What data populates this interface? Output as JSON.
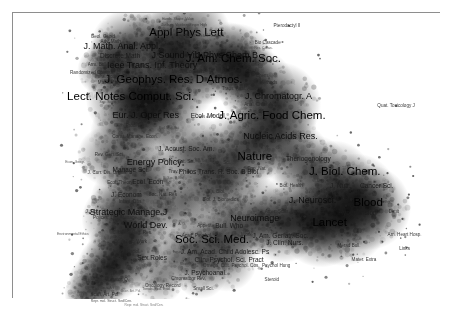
{
  "figure": {
    "kind": "science-map",
    "frame": {
      "border_color": "#8e8e8e",
      "background": "#ffffff"
    },
    "palette": {
      "background": "#ffffff",
      "density_low": "#d9d9d9",
      "density_mid": "#9a9a9a",
      "density_high": "#4a4a4a",
      "density_peak": "#1e1e1e",
      "label_color": "#111111",
      "point_color": "#2b2b2b",
      "frame_color": "#8e8e8e"
    }
  },
  "chart_data": {
    "type": "scatter",
    "title": "",
    "xlabel": "",
    "ylabel": "",
    "xlim": [
      0,
      100
    ],
    "ylim": [
      0,
      100
    ],
    "grid": false,
    "legend": "none",
    "encoding": {
      "x": "map coordinate 1",
      "y": "map coordinate 2",
      "size": "label font tier (1 = largest / most prominent journal)",
      "shade": "kernel density of journals in the neighbourhood"
    },
    "labels": [
      {
        "text": "Lect. Notes Comput. Sci.",
        "x": 27.5,
        "y": 70.5,
        "tier": 1
      },
      {
        "text": "J. Am. Chem. Soc.",
        "x": 51.5,
        "y": 84.0,
        "tier": 1
      },
      {
        "text": "J. Biol. Chem.",
        "x": 77.5,
        "y": 44.5,
        "tier": 1
      },
      {
        "text": "Appl Phys Lett",
        "x": 40.5,
        "y": 93.0,
        "tier": 1
      },
      {
        "text": "J. Geophys. Res. D Atmos.",
        "x": 37.5,
        "y": 76.5,
        "tier": 1
      },
      {
        "text": "J. Agric. Food Chem.",
        "x": 60.5,
        "y": 64.0,
        "tier": 1
      },
      {
        "text": "Lancet",
        "x": 74.0,
        "y": 26.5,
        "tier": 1
      },
      {
        "text": "Soc. Sci. Med.",
        "x": 46.5,
        "y": 20.5,
        "tier": 1
      },
      {
        "text": "Nature",
        "x": 56.5,
        "y": 49.5,
        "tier": 1
      },
      {
        "text": "Blood",
        "x": 83.0,
        "y": 33.5,
        "tier": 1
      },
      {
        "text": "Nucleic Acids Res.",
        "x": 62.5,
        "y": 57.0,
        "tier": 2
      },
      {
        "text": "J. Chromatogr. A",
        "x": 62.0,
        "y": 71.0,
        "tier": 2
      },
      {
        "text": "Eur. J. Oper Res",
        "x": 31.0,
        "y": 64.5,
        "tier": 2
      },
      {
        "text": "J. Neurosci.",
        "x": 70.0,
        "y": 34.5,
        "tier": 2
      },
      {
        "text": "Ieee Trans. Inf. Theory",
        "x": 32.5,
        "y": 82.0,
        "tier": 2
      },
      {
        "text": "J Sound Vib",
        "x": 38.0,
        "y": 85.5,
        "tier": 2
      },
      {
        "text": "J Phys Chem B",
        "x": 50.0,
        "y": 85.5,
        "tier": 2
      },
      {
        "text": "Energy Policy",
        "x": 33.0,
        "y": 48.0,
        "tier": 2
      },
      {
        "text": "World Dev.",
        "x": 31.0,
        "y": 26.0,
        "tier": 2
      },
      {
        "text": "Strategic Manage J",
        "x": 27.0,
        "y": 30.5,
        "tier": 2
      },
      {
        "text": "Neuroimage",
        "x": 56.5,
        "y": 28.5,
        "tier": 2
      },
      {
        "text": "J. Math. Anal. Appl.",
        "x": 25.5,
        "y": 88.5,
        "tier": 2
      },
      {
        "text": "Hypertension",
        "x": 80.5,
        "y": 30.0,
        "tier": 3
      },
      {
        "text": "Ecol. Econ",
        "x": 31.5,
        "y": 41.0,
        "tier": 3
      },
      {
        "text": "Manage Sci.",
        "x": 27.5,
        "y": 45.0,
        "tier": 3
      },
      {
        "text": "J. Nutr.",
        "x": 76.5,
        "y": 39.5,
        "tier": 3
      },
      {
        "text": "Sex Roles",
        "x": 32.5,
        "y": 14.5,
        "tier": 3
      },
      {
        "text": "J. Am. Acad. Child Adolesc. Ps",
        "x": 49.5,
        "y": 16.5,
        "tier": 3
      },
      {
        "text": "J. Am. Geriatr. Soc.",
        "x": 62.5,
        "y": 22.0,
        "tier": 3
      },
      {
        "text": "J. Econom",
        "x": 26.5,
        "y": 36.5,
        "tier": 3
      },
      {
        "text": "Ecol. Model",
        "x": 45.5,
        "y": 64.0,
        "tier": 3
      },
      {
        "text": "Philos Trans. R. Soc. B Biol",
        "x": 48.0,
        "y": 44.5,
        "tier": 3
      },
      {
        "text": "J. Acoust. Soc. Am.",
        "x": 40.5,
        "y": 52.5,
        "tier": 3
      },
      {
        "text": "Theriogenology",
        "x": 69.0,
        "y": 49.0,
        "tier": 3
      },
      {
        "text": "Discrete Math",
        "x": 25.0,
        "y": 85.0,
        "tier": 3
      },
      {
        "text": "Cancer Sci.",
        "x": 85.0,
        "y": 39.5,
        "tier": 3
      },
      {
        "text": "J. Clin. Nurs.",
        "x": 63.5,
        "y": 19.5,
        "tier": 3
      },
      {
        "text": "Bull. Who",
        "x": 50.5,
        "y": 25.5,
        "tier": 3
      },
      {
        "text": "Clin. Psychol. Sci. Pract",
        "x": 50.5,
        "y": 13.5,
        "tier": 3
      },
      {
        "text": "J. Psychoanal.",
        "x": 45.0,
        "y": 9.0,
        "tier": 3
      },
      {
        "text": "Appetite",
        "x": 45.0,
        "y": 25.5,
        "tier": 4
      },
      {
        "text": "Soc. Nat. Res",
        "x": 35.0,
        "y": 36.5,
        "tier": 4
      },
      {
        "text": "Ecol. Theory",
        "x": 25.0,
        "y": 40.5,
        "tier": 4
      },
      {
        "text": "Sat. Sci.",
        "x": 40.5,
        "y": 48.0,
        "tier": 4
      },
      {
        "text": "Trans. Anal. Analyst",
        "x": 53.5,
        "y": 73.5,
        "tier": 4
      },
      {
        "text": "Anal. Chim. Acta",
        "x": 58.0,
        "y": 68.0,
        "tier": 4
      },
      {
        "text": "El. Chem.",
        "x": 57.5,
        "y": 78.0,
        "tier": 4
      },
      {
        "text": "Biol. Methods",
        "x": 58.5,
        "y": 75.5,
        "tier": 4
      },
      {
        "text": "Math. Mag.",
        "x": 22.5,
        "y": 75.5,
        "tier": 4
      },
      {
        "text": "Rev. Gen. Sci.",
        "x": 22.5,
        "y": 50.5,
        "tier": 4
      },
      {
        "text": "J. Curr. Dis. Organ.",
        "x": 22.0,
        "y": 44.0,
        "tier": 4
      },
      {
        "text": "Infant. Obs.",
        "x": 27.5,
        "y": 34.0,
        "tier": 4
      },
      {
        "text": "J. Urban Reg. Res.",
        "x": 28.0,
        "y": 23.0,
        "tier": 4
      },
      {
        "text": "Br. J. Soc. Work",
        "x": 27.5,
        "y": 20.0,
        "tier": 4
      },
      {
        "text": "Am. J. Sociol.",
        "x": 26.5,
        "y": 16.5,
        "tier": 4
      },
      {
        "text": "Acad. Psychol.",
        "x": 43.0,
        "y": 22.0,
        "tier": 4
      },
      {
        "text": "Work",
        "x": 54.5,
        "y": 22.5,
        "tier": 4
      },
      {
        "text": "Omega. Cult. Psychol. Cos.",
        "x": 51.0,
        "y": 11.5,
        "tier": 4
      },
      {
        "text": "Psychol Hung",
        "x": 61.5,
        "y": 11.5,
        "tier": 4
      },
      {
        "text": "Chromatogr Rev.",
        "x": 41.0,
        "y": 7.0,
        "tier": 4
      },
      {
        "text": "Oncology Record",
        "x": 35.0,
        "y": 4.5,
        "tier": 4
      },
      {
        "text": "Small Sci.",
        "x": 44.5,
        "y": 3.5,
        "tier": 4
      },
      {
        "text": "Curator. Q.",
        "x": 24.5,
        "y": 6.5,
        "tier": 4
      },
      {
        "text": "Scan. Art. Pol.",
        "x": 21.5,
        "y": 1.5,
        "tier": 4
      },
      {
        "text": "Steroid",
        "x": 60.5,
        "y": 6.5,
        "tier": 4
      },
      {
        "text": "Merad Bull.",
        "x": 78.5,
        "y": 18.5,
        "tier": 4
      },
      {
        "text": "Mater. Extra",
        "x": 82.0,
        "y": 13.5,
        "tier": 4
      },
      {
        "text": "Links",
        "x": 91.5,
        "y": 17.5,
        "tier": 4
      },
      {
        "text": "Dimit",
        "x": 89.0,
        "y": 30.5,
        "tier": 4
      },
      {
        "text": "Am. Heart Hosp.",
        "x": 91.5,
        "y": 22.5,
        "tier": 4
      },
      {
        "text": "Quat. Toxicology J",
        "x": 89.5,
        "y": 67.5,
        "tier": 4
      },
      {
        "text": "Pterodactyl II",
        "x": 64.0,
        "y": 95.5,
        "tier": 4
      },
      {
        "text": "Bio Cascade",
        "x": 59.5,
        "y": 89.5,
        "tier": 4
      },
      {
        "text": "Mech. Combust.",
        "x": 41.0,
        "y": 79.5,
        "tier": 4
      },
      {
        "text": "Arm. Bulletin",
        "x": 20.5,
        "y": 82.0,
        "tier": 4
      },
      {
        "text": "Randomized Comput.",
        "x": 18.5,
        "y": 79.0,
        "tier": 4
      },
      {
        "text": "Geol. Geoid",
        "x": 21.0,
        "y": 91.5,
        "tier": 4
      },
      {
        "text": "Adv. Math.",
        "x": 23.0,
        "y": 90.0,
        "tier": 4
      },
      {
        "text": "Infra. Sci.",
        "x": 21.5,
        "y": 77.5,
        "tier": 4
      },
      {
        "text": "Proc. Lgwl.",
        "x": 29.0,
        "y": 60.5,
        "tier": 4
      },
      {
        "text": "Const. Manage. Econ.",
        "x": 28.5,
        "y": 56.5,
        "tier": 4
      },
      {
        "text": "Vis. Biol.",
        "x": 47.5,
        "y": 37.5,
        "tier": 4
      },
      {
        "text": "Biol. J. Biomedics",
        "x": 48.5,
        "y": 34.5,
        "tier": 4
      },
      {
        "text": "Biol. Health",
        "x": 65.0,
        "y": 39.5,
        "tier": 4
      },
      {
        "text": "Amer. Scan. Behav.",
        "x": 63.5,
        "y": 30.5,
        "tier": 4
      },
      {
        "text": "Trav.",
        "x": 37.5,
        "y": 44.5,
        "tier": 4
      },
      {
        "text": "Sci.",
        "x": 50.0,
        "y": 47.5,
        "tier": 4
      },
      {
        "text": "Pop. Nat.",
        "x": 57.0,
        "y": 45.5,
        "tier": 4
      },
      {
        "text": "J. Tax.",
        "x": 18.5,
        "y": 30.5,
        "tier": 4
      },
      {
        "text": "Polices. Libr. Manage.",
        "x": 24.0,
        "y": 28.5,
        "tier": 4
      },
      {
        "text": "Environmental Ethics",
        "x": 14.0,
        "y": 22.5,
        "tier": 5
      },
      {
        "text": "Econ. Geogr.",
        "x": 14.5,
        "y": 47.5,
        "tier": 5
      },
      {
        "text": "Tetrahedron",
        "x": 31.5,
        "y": 73.5,
        "tier": 5
      },
      {
        "text": "A. G.",
        "x": 39.5,
        "y": 26.0,
        "tier": 5
      },
      {
        "text": "Sal. Sci.",
        "x": 44.0,
        "y": 48.0,
        "tier": 5
      },
      {
        "text": "R. Soc. B Biol",
        "x": 37.5,
        "y": 42.0,
        "tier": 5
      },
      {
        "text": "Inquiry",
        "x": 38.5,
        "y": 16.0,
        "tier": 5
      },
      {
        "text": "Rhizo. Res.",
        "x": 41.0,
        "y": 12.0,
        "tier": 5
      },
      {
        "text": "Sun. Soc. Sci.",
        "x": 27.5,
        "y": 10.5,
        "tier": 5
      },
      {
        "text": "Trends. Ecol. Evol.",
        "x": 33.5,
        "y": 3.0,
        "tier": 5
      },
      {
        "text": "Scan. Art.",
        "x": 22.0,
        "y": 3.5,
        "tier": 5
      },
      {
        "text": "Hands. Shape. Value",
        "x": 38.5,
        "y": 97.5,
        "tier": 5
      },
      {
        "text": "Tanburg. Viceberg Finger High",
        "x": 40.0,
        "y": 95.5,
        "tier": 5
      },
      {
        "text": "Tech. Mech. Eng Int.",
        "x": 36.5,
        "y": 93.5,
        "tier": 5
      },
      {
        "text": "Clan. Phys. C. Q. Technol. Sci. Mic. Condens.",
        "x": 41.5,
        "y": 91.5,
        "tier": 5
      },
      {
        "text": "Res. Cacas.",
        "x": 58.5,
        "y": 87.5,
        "tier": 5
      },
      {
        "text": "Mech. Combust.",
        "x": 37.5,
        "y": 80.5,
        "tier": 5
      },
      {
        "text": "Chem.",
        "x": 34.5,
        "y": 74.5,
        "tier": 5
      },
      {
        "text": "Sep. Scien. Sci.",
        "x": 23.0,
        "y": 68.5,
        "tier": 5
      },
      {
        "text": "Biol. Mat. Sci.",
        "x": 36.5,
        "y": 59.5,
        "tier": 5
      },
      {
        "text": "Scan. Hemati.",
        "x": 17.5,
        "y": 2.0,
        "tier": 5
      },
      {
        "text": "Repr. mol. Struct. Sed/Cen.",
        "x": 23.0,
        "y": -1.0,
        "tier": 5
      }
    ],
    "density_blobs": [
      {
        "x": 27,
        "y": 88,
        "r": 9,
        "w": 0.85
      },
      {
        "x": 24,
        "y": 84,
        "r": 7,
        "w": 0.8
      },
      {
        "x": 21,
        "y": 80,
        "r": 6,
        "w": 0.7
      },
      {
        "x": 33,
        "y": 90,
        "r": 8,
        "w": 0.75
      },
      {
        "x": 41,
        "y": 92,
        "r": 10,
        "w": 0.9
      },
      {
        "x": 38,
        "y": 86,
        "r": 8,
        "w": 0.8
      },
      {
        "x": 50,
        "y": 85,
        "r": 8,
        "w": 0.75
      },
      {
        "x": 52,
        "y": 83,
        "r": 9,
        "w": 0.88
      },
      {
        "x": 45,
        "y": 80,
        "r": 8,
        "w": 0.78
      },
      {
        "x": 37,
        "y": 77,
        "r": 11,
        "w": 0.92
      },
      {
        "x": 30,
        "y": 73,
        "r": 9,
        "w": 0.82
      },
      {
        "x": 27,
        "y": 70,
        "r": 10,
        "w": 0.86
      },
      {
        "x": 35,
        "y": 67,
        "r": 9,
        "w": 0.8
      },
      {
        "x": 31,
        "y": 63,
        "r": 9,
        "w": 0.78
      },
      {
        "x": 26,
        "y": 58,
        "r": 8,
        "w": 0.7
      },
      {
        "x": 22,
        "y": 50,
        "r": 7,
        "w": 0.62
      },
      {
        "x": 28,
        "y": 46,
        "r": 8,
        "w": 0.72
      },
      {
        "x": 32,
        "y": 41,
        "r": 8,
        "w": 0.7
      },
      {
        "x": 27,
        "y": 34,
        "r": 9,
        "w": 0.8
      },
      {
        "x": 24,
        "y": 28,
        "r": 8,
        "w": 0.76
      },
      {
        "x": 28,
        "y": 22,
        "r": 9,
        "w": 0.82
      },
      {
        "x": 26,
        "y": 16,
        "r": 9,
        "w": 0.9
      },
      {
        "x": 23,
        "y": 11,
        "r": 8,
        "w": 0.92
      },
      {
        "x": 20,
        "y": 6,
        "r": 7,
        "w": 0.88
      },
      {
        "x": 17,
        "y": 2,
        "r": 5,
        "w": 0.7
      },
      {
        "x": 41,
        "y": 52,
        "r": 9,
        "w": 0.72
      },
      {
        "x": 46,
        "y": 46,
        "r": 9,
        "w": 0.7
      },
      {
        "x": 52,
        "y": 50,
        "r": 10,
        "w": 0.8
      },
      {
        "x": 57,
        "y": 55,
        "r": 9,
        "w": 0.78
      },
      {
        "x": 61,
        "y": 60,
        "r": 10,
        "w": 0.84
      },
      {
        "x": 62,
        "y": 68,
        "r": 10,
        "w": 0.85
      },
      {
        "x": 57,
        "y": 74,
        "r": 9,
        "w": 0.8
      },
      {
        "x": 54,
        "y": 78,
        "r": 8,
        "w": 0.74
      },
      {
        "x": 66,
        "y": 50,
        "r": 8,
        "w": 0.68
      },
      {
        "x": 70,
        "y": 44,
        "r": 9,
        "w": 0.7
      },
      {
        "x": 75,
        "y": 42,
        "r": 9,
        "w": 0.72
      },
      {
        "x": 80,
        "y": 36,
        "r": 10,
        "w": 0.84
      },
      {
        "x": 83,
        "y": 32,
        "r": 10,
        "w": 0.92
      },
      {
        "x": 77,
        "y": 28,
        "r": 11,
        "w": 0.95
      },
      {
        "x": 72,
        "y": 26,
        "r": 10,
        "w": 0.93
      },
      {
        "x": 68,
        "y": 29,
        "r": 9,
        "w": 0.86
      },
      {
        "x": 63,
        "y": 26,
        "r": 9,
        "w": 0.8
      },
      {
        "x": 58,
        "y": 29,
        "r": 9,
        "w": 0.78
      },
      {
        "x": 53,
        "y": 25,
        "r": 8,
        "w": 0.7
      },
      {
        "x": 48,
        "y": 21,
        "r": 9,
        "w": 0.74
      },
      {
        "x": 43,
        "y": 18,
        "r": 8,
        "w": 0.68
      },
      {
        "x": 38,
        "y": 14,
        "r": 7,
        "w": 0.62
      },
      {
        "x": 50,
        "y": 13,
        "r": 7,
        "w": 0.58
      },
      {
        "x": 44,
        "y": 9,
        "r": 6,
        "w": 0.5
      },
      {
        "x": 34,
        "y": 7,
        "r": 6,
        "w": 0.56
      },
      {
        "x": 46,
        "y": 36,
        "r": 8,
        "w": 0.55
      },
      {
        "x": 50,
        "y": 40,
        "r": 8,
        "w": 0.58
      },
      {
        "x": 36,
        "y": 31,
        "r": 8,
        "w": 0.62
      },
      {
        "x": 40,
        "y": 35,
        "r": 7,
        "w": 0.55
      }
    ]
  },
  "caption": {
    "line1": "Scan. Art. Pol.",
    "line2": "Repr. mol. Struct. Sed/Cen."
  }
}
